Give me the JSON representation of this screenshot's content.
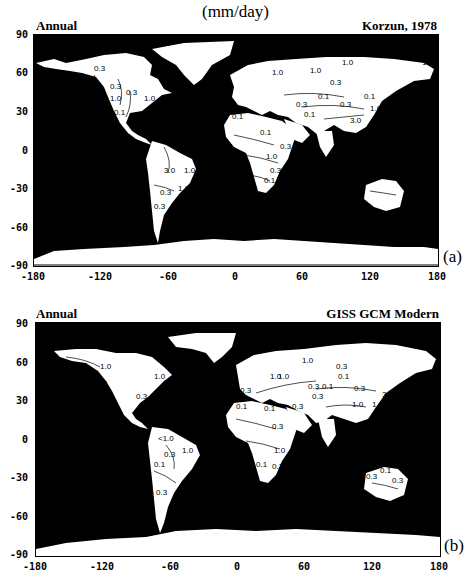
{
  "figure": {
    "units": "(mm/day)",
    "panels": [
      {
        "id": "a",
        "title_left": "Annual",
        "title_right": "Korzun, 1978",
        "panel_label": "(a)",
        "y_ticks": [
          "90",
          "60",
          "30",
          "0",
          "-30",
          "-60",
          "-90"
        ],
        "x_ticks": [
          "-180",
          "-120",
          "-60",
          "0",
          "60",
          "120",
          "180"
        ],
        "contour_labels": [
          "0.3",
          "0.3",
          "0.3",
          "1.0",
          "1.0",
          "0.1",
          "3.0",
          "1.0",
          "1.0",
          "0.3",
          "0.3",
          "1.0",
          "1.0",
          "1.0",
          "1.0",
          "0.3",
          "0.1",
          "0.1",
          "0.3",
          "0.1",
          "0.3",
          "1.0",
          "3.0",
          "0.1",
          "0.1",
          "0.3",
          "1.0",
          "0.3",
          "0.1",
          "0.3",
          "0.1"
        ]
      },
      {
        "id": "b",
        "title_left": "Annual",
        "title_right": "GISS GCM Modern",
        "panel_label": "(b)",
        "y_ticks": [
          "90",
          "60",
          "30",
          "0",
          "-30",
          "-60",
          "-90"
        ],
        "x_ticks": [
          "-180",
          "-120",
          "-60",
          "0",
          "60",
          "120",
          "180"
        ],
        "contour_labels": [
          "1.0",
          "1.0",
          "0.3",
          "0.3",
          "<1.0",
          "0.3",
          "1.0",
          "0.1",
          "0.3",
          "1.0",
          "1.0",
          "1.0",
          "0.3",
          "0.1",
          "0.3",
          "0.1",
          "0.3",
          "3.0",
          "0.3",
          "0.3",
          "0.1",
          "0.1",
          "0.3",
          "1.0",
          "1.0",
          "3.0",
          "0.3",
          "1.0",
          "0.1",
          "0.3",
          "0.3",
          "0.1",
          "0.3"
        ]
      }
    ]
  },
  "colors": {
    "ocean": "#000000",
    "land": "#ffffff",
    "contour": "#000000"
  }
}
